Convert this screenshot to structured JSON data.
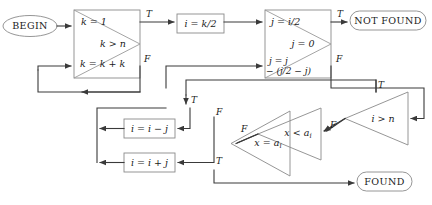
{
  "diagram": {
    "colors": {
      "stroke": "#3a3a3a",
      "box_stroke": "#8a8a8a",
      "text": "#1a1a1a",
      "background": "#ffffff"
    }
  },
  "terminals": {
    "begin": "BEGIN",
    "not_found": "NOT FOUND",
    "found": "FOUND"
  },
  "nodes": {
    "k_init": "k = 1",
    "k_test": "k > n",
    "k_double": "k = k + k",
    "i_assign": "i = k/2",
    "j_assign": "j = i/2",
    "j_test": "j = 0",
    "j_update_line1": "j = j",
    "j_update_line2": "− (j/2 − j)",
    "i_minus": "i = i − j",
    "i_plus": "i = i + j",
    "x_eq": "x = a",
    "x_eq_sub": "i",
    "x_lt": "x < a",
    "x_lt_sub": "i",
    "i_gt_n": "i > n"
  },
  "edge_labels": {
    "k_true": "T",
    "k_false": "F",
    "j_true": "T",
    "j_false": "F",
    "n_true": "T",
    "n_false": "F",
    "lt_true": "T",
    "lt_false": "F",
    "eq_true": "T",
    "eq_false": "F"
  }
}
